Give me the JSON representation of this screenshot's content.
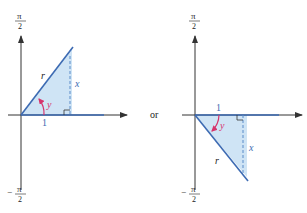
{
  "colors": {
    "axis": "#333333",
    "line": "#3d6bb3",
    "fill": "#cfe4f5",
    "dashed": "#5b8cc9",
    "angle": "#d6336c",
    "label_blue": "#3d6bb3",
    "text": "#222222"
  },
  "left_diagram": {
    "top_label_num": "π",
    "top_label_den": "2",
    "bottom_label_sign": "−",
    "bottom_label_num": "π",
    "bottom_label_den": "2",
    "hyp_label": "r",
    "side_label": "x",
    "angle_label": "y",
    "base_label": "1"
  },
  "connector": "or",
  "right_diagram": {
    "top_label_num": "π",
    "top_label_den": "2",
    "bottom_label_sign": "−",
    "bottom_label_num": "π",
    "bottom_label_den": "2",
    "hyp_label": "r",
    "side_label": "x",
    "angle_label": "y",
    "base_label": "1"
  }
}
